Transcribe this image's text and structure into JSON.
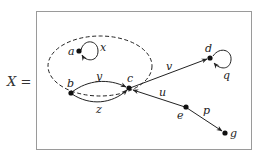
{
  "diagram": {
    "type": "directed-graph",
    "set_label": "X",
    "equals_sign": "=",
    "set_label_full": "X =",
    "nodes": [
      {
        "id": "a",
        "label": "a"
      },
      {
        "id": "b",
        "label": "b"
      },
      {
        "id": "c",
        "label": "c"
      },
      {
        "id": "d",
        "label": "d"
      },
      {
        "id": "e",
        "label": "e"
      },
      {
        "id": "g",
        "label": "g"
      }
    ],
    "edges": [
      {
        "id": "x",
        "label": "x",
        "from": "a",
        "to": "a",
        "kind": "loop"
      },
      {
        "id": "y",
        "label": "y",
        "from": "b",
        "to": "c"
      },
      {
        "id": "z",
        "label": "z",
        "from": "b",
        "to": "c"
      },
      {
        "id": "v",
        "label": "v",
        "from": "c",
        "to": "d"
      },
      {
        "id": "q",
        "label": "q",
        "from": "d",
        "to": "d",
        "kind": "loop"
      },
      {
        "id": "u",
        "label": "u",
        "from": "e",
        "to": "c"
      },
      {
        "id": "p",
        "label": "p",
        "from": "e",
        "to": "g"
      }
    ],
    "subgraph": {
      "style": "dashed-ellipse",
      "contains": [
        "a",
        "b",
        "c"
      ]
    },
    "colors": {
      "ink": "#222222",
      "frame": "#9a9a9a",
      "background": "#ffffff"
    }
  }
}
